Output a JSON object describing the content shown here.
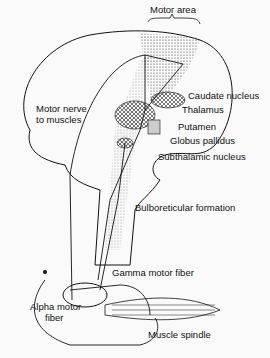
{
  "diagram": {
    "labels": {
      "motor_area": "Motor area",
      "caudate": "Caudate nucleus",
      "thalamus": "Thalamus",
      "motor_nerve_1": "Motor nerve",
      "motor_nerve_2": "to muscles",
      "putamen": "Putamen",
      "globus": "Globus pallidus",
      "subthalamic": "Subthalamic nucleus",
      "bulboreticular": "Bulboreticular formation",
      "gamma": "Gamma motor fiber",
      "alpha_1": "Alpha motor",
      "alpha_2": "fiber",
      "spindle": "Muscle spindle"
    }
  }
}
